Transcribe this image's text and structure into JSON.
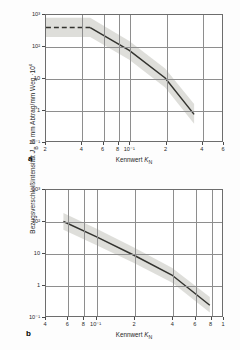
{
  "figure": {
    "y_axis_label": "Bezugsverschleißintensität",
    "y_axis_symbol": "J",
    "y_axis_symbol_sub": "B",
    "y_axis_units": " in mm Abtrag/mm Weg ·10",
    "y_axis_units_exp": "6",
    "x_axis_label": "Kennwert ",
    "x_axis_symbol": "K",
    "x_axis_symbol_sub": "N",
    "panel_a_label": "a",
    "panel_b_label": "b",
    "line_color": "#33332f",
    "band_color": "#c9c9c4",
    "grid_color": "#8e8e8e",
    "frame_color": "#6d6d6d"
  },
  "chart_data": [
    {
      "type": "line",
      "panel": "a",
      "title": "",
      "xlabel": "Kennwert K_N",
      "ylabel": "Bezugsverschleißintensität J_B in mm Abtrag/mm Weg ·10^6",
      "xscale": "log",
      "yscale": "log",
      "xlim": [
        0.02,
        0.6
      ],
      "ylim": [
        0.1,
        1000
      ],
      "grid": true,
      "legend": "none",
      "xtick_labels": [
        "2",
        "4",
        "6",
        "8",
        "10⁻¹",
        "2",
        "4",
        "6"
      ],
      "xtick_values": [
        0.02,
        0.04,
        0.06,
        0.08,
        0.1,
        0.2,
        0.4,
        0.6
      ],
      "ytick_labels": [
        "10³",
        "10²",
        "10",
        "1",
        "10⁻¹"
      ],
      "ytick_values": [
        1000,
        100,
        10,
        1,
        0.1
      ],
      "series": [
        {
          "name": "plateau",
          "style": "dashed",
          "x": [
            0.02,
            0.047
          ],
          "y": [
            400,
            400
          ]
        },
        {
          "name": "descending-branch",
          "style": "solid",
          "x": [
            0.047,
            0.1,
            0.2,
            0.35
          ],
          "y": [
            400,
            75,
            10,
            0.7
          ]
        }
      ],
      "scatter_band": {
        "name": "streuband",
        "description": "grey scatter band around the curve",
        "upper_x": [
          0.02,
          0.047,
          0.1,
          0.2,
          0.35
        ],
        "upper_y": [
          820,
          820,
          150,
          20,
          1.5
        ],
        "lower_x": [
          0.02,
          0.047,
          0.1,
          0.2,
          0.35
        ],
        "lower_y": [
          200,
          200,
          38,
          5,
          0.35
        ]
      }
    },
    {
      "type": "line",
      "panel": "b",
      "title": "",
      "xlabel": "Kennwert K_N",
      "ylabel": "Bezugsverschleißintensität J_B in mm Abtrag/mm Weg ·10^6",
      "xscale": "log",
      "yscale": "log",
      "xlim": [
        0.04,
        1.0
      ],
      "ylim": [
        0.1,
        1000
      ],
      "grid": true,
      "legend": "none",
      "xtick_labels": [
        "4",
        "6",
        "8",
        "10⁻¹",
        "2",
        "4",
        "6",
        "8",
        "1"
      ],
      "xtick_values": [
        0.04,
        0.06,
        0.08,
        0.1,
        0.2,
        0.4,
        0.6,
        0.8,
        1.0
      ],
      "ytick_labels": [
        "10³",
        "10²",
        "10",
        "1",
        "10⁻¹"
      ],
      "ytick_values": [
        1000,
        100,
        10,
        1,
        0.1
      ],
      "series": [
        {
          "name": "wear-line",
          "style": "solid",
          "x": [
            0.055,
            0.1,
            0.2,
            0.4,
            0.8
          ],
          "y": [
            100,
            33,
            8.5,
            2.0,
            0.22
          ]
        }
      ],
      "scatter_band": {
        "name": "streuband",
        "description": "grey scatter band around the line",
        "upper_x": [
          0.055,
          0.1,
          0.2,
          0.4,
          0.8
        ],
        "upper_y": [
          185,
          60,
          15,
          3.4,
          0.4
        ],
        "lower_x": [
          0.055,
          0.1,
          0.2,
          0.4,
          0.8
        ],
        "lower_y": [
          55,
          18,
          4.8,
          1.15,
          0.13
        ]
      }
    }
  ]
}
